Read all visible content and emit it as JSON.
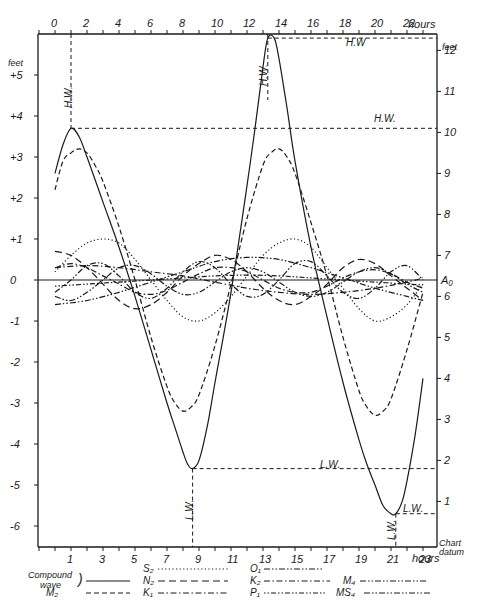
{
  "chart_data": {
    "type": "line",
    "title": "",
    "xlabel": "hours",
    "ylabel_left": "feet",
    "ylabel_right": "feet",
    "top_axis": {
      "ticks": [
        0,
        2,
        4,
        6,
        8,
        10,
        12,
        14,
        16,
        18,
        20,
        22
      ],
      "unit": "hours"
    },
    "bottom_axis": {
      "ticks": [
        1,
        3,
        5,
        7,
        9,
        11,
        13,
        15,
        17,
        19,
        21,
        23
      ],
      "unit": "hours"
    },
    "left_axis": {
      "ticks": [
        5,
        4,
        3,
        2,
        1,
        0,
        -1,
        -2,
        -3,
        -4,
        -5,
        -6
      ],
      "labels": [
        "+5",
        "+4",
        "+3",
        "+2",
        "+1",
        "0",
        "-1",
        "-2",
        "-3",
        "-4",
        "-5",
        "-6"
      ],
      "unit": "feet"
    },
    "right_axis": {
      "ticks": [
        12,
        11,
        10,
        9,
        8,
        7,
        6,
        5,
        4,
        3,
        2,
        1
      ],
      "labels": [
        "12",
        "11",
        "10",
        "9",
        "8",
        "7",
        "6",
        "5",
        "4",
        "3",
        "2",
        "1"
      ],
      "unit": "feet",
      "a0_label": "A₀",
      "a0_value": 6.4,
      "datum_label": [
        "Chart",
        "datum"
      ]
    },
    "xlim": [
      -1,
      23.9
    ],
    "ylim": [
      -6.5,
      6.1
    ],
    "grid": false,
    "annotations": [
      {
        "text": "H.W.",
        "x": 1.0,
        "y": 3.7,
        "type": "high-water"
      },
      {
        "text": "H.W",
        "x": 13.3,
        "y": 5.9,
        "type": "high-water"
      },
      {
        "text": "L.W.",
        "x": 8.6,
        "y": -4.6,
        "type": "low-water"
      },
      {
        "text": "L.W.",
        "x": 21.3,
        "y": -5.7,
        "type": "low-water"
      }
    ],
    "series": [
      {
        "name": "Compound wave",
        "style": "solid",
        "x": [
          0,
          0.5,
          1,
          1.5,
          2,
          3,
          4,
          5,
          6,
          7,
          7.5,
          8,
          8.3,
          8.6,
          9,
          9.5,
          10,
          11,
          12,
          12.5,
          13,
          13.3,
          13.7,
          14,
          14.5,
          15,
          16,
          17,
          18,
          19,
          19.5,
          20,
          20.5,
          21,
          21.3,
          21.7,
          22,
          22.5,
          23
        ],
        "y": [
          2.6,
          3.3,
          3.7,
          3.5,
          3.0,
          1.9,
          0.8,
          -0.4,
          -1.7,
          -3.0,
          -3.6,
          -4.2,
          -4.5,
          -4.6,
          -4.4,
          -3.6,
          -2.5,
          -0.3,
          2.3,
          3.7,
          5.2,
          5.9,
          5.9,
          5.4,
          4.2,
          2.9,
          0.8,
          -0.9,
          -2.5,
          -3.9,
          -4.5,
          -5.0,
          -5.5,
          -5.7,
          -5.7,
          -5.4,
          -4.9,
          -3.8,
          -2.4
        ]
      },
      {
        "name": "M2",
        "style": "dash",
        "x": [
          0,
          0.5,
          1,
          1.5,
          2,
          2.5,
          3,
          4,
          5,
          6,
          7,
          7.5,
          8,
          8.5,
          9,
          10,
          11,
          12,
          13,
          13.5,
          14,
          14.5,
          15,
          16,
          17,
          18,
          19,
          19.5,
          20,
          20.5,
          21,
          22,
          23
        ],
        "y": [
          2.2,
          2.9,
          3.1,
          3.2,
          3.1,
          2.8,
          2.4,
          1.3,
          0.0,
          -1.4,
          -2.6,
          -3.0,
          -3.2,
          -3.1,
          -2.8,
          -1.6,
          -0.1,
          1.5,
          2.8,
          3.1,
          3.2,
          3.0,
          2.6,
          1.4,
          0.1,
          -1.4,
          -2.7,
          -3.1,
          -3.3,
          -3.2,
          -2.9,
          -1.7,
          -0.3
        ]
      },
      {
        "name": "S2",
        "style": "dot",
        "x": [
          0,
          1,
          2,
          3,
          4,
          5,
          6,
          7,
          8,
          9,
          10,
          11,
          12,
          13,
          14,
          15,
          16,
          17,
          18,
          19,
          20,
          21,
          22,
          23
        ],
        "y": [
          0.2,
          0.6,
          0.9,
          1.0,
          0.9,
          0.5,
          0.0,
          -0.5,
          -0.9,
          -1.0,
          -0.8,
          -0.4,
          0.1,
          0.6,
          0.9,
          1.0,
          0.8,
          0.3,
          -0.2,
          -0.7,
          -1.0,
          -0.9,
          -0.6,
          -0.1
        ]
      },
      {
        "name": "N2",
        "style": "longdash",
        "x": [
          0,
          1,
          2,
          3,
          4,
          5,
          6,
          7,
          8,
          9,
          10,
          11,
          12,
          13,
          14,
          15,
          16,
          17,
          18,
          19,
          20,
          21,
          22,
          23
        ],
        "y": [
          0.7,
          0.6,
          0.3,
          -0.1,
          -0.5,
          -0.7,
          -0.6,
          -0.3,
          0.1,
          0.4,
          0.6,
          0.5,
          0.2,
          -0.2,
          -0.5,
          -0.6,
          -0.4,
          -0.1,
          0.3,
          0.5,
          0.4,
          0.1,
          -0.2,
          -0.5
        ]
      },
      {
        "name": "K1",
        "style": "dashdot",
        "x": [
          0,
          2,
          4,
          6,
          8,
          10,
          12,
          14,
          16,
          18,
          20,
          22,
          23
        ],
        "y": [
          0.3,
          0.35,
          0.3,
          0.2,
          0.1,
          -0.05,
          -0.2,
          -0.3,
          -0.35,
          -0.3,
          -0.2,
          -0.05,
          0.05
        ]
      },
      {
        "name": "O1",
        "style": "dashdotdot",
        "x": [
          0,
          2,
          4,
          6,
          8,
          10,
          12,
          14,
          16,
          18,
          20,
          22,
          23
        ],
        "y": [
          -0.6,
          -0.5,
          -0.3,
          -0.05,
          0.2,
          0.45,
          0.55,
          0.5,
          0.3,
          0.05,
          -0.2,
          -0.4,
          -0.5
        ]
      },
      {
        "name": "K2",
        "style": "dashdot",
        "x": [
          0,
          1,
          2,
          3,
          4,
          5,
          6,
          7,
          8,
          9,
          10,
          11,
          12,
          13,
          14,
          15,
          16,
          17,
          18,
          19,
          20,
          21,
          22,
          23
        ],
        "y": [
          0.3,
          0.4,
          0.3,
          0.1,
          -0.1,
          -0.3,
          -0.35,
          -0.25,
          -0.05,
          0.15,
          0.3,
          0.3,
          0.2,
          0.0,
          -0.2,
          -0.3,
          -0.3,
          -0.15,
          0.05,
          0.2,
          0.25,
          0.15,
          -0.05,
          -0.2
        ]
      },
      {
        "name": "P1",
        "style": "dotdash",
        "x": [
          0,
          2,
          4,
          6,
          8,
          10,
          12,
          14,
          16,
          18,
          20,
          22,
          23
        ],
        "y": [
          -0.15,
          -0.1,
          -0.05,
          0.0,
          0.05,
          0.1,
          0.12,
          0.1,
          0.05,
          0.0,
          -0.05,
          -0.1,
          -0.12
        ]
      },
      {
        "name": "M4",
        "style": "dashdotdot",
        "x": [
          0,
          1,
          2,
          3,
          4,
          5,
          6,
          7,
          8,
          9,
          10,
          11,
          12,
          13,
          14,
          15,
          16,
          17,
          18,
          19,
          20,
          21,
          22,
          23
        ],
        "y": [
          -0.3,
          0.0,
          0.35,
          0.4,
          0.1,
          -0.3,
          -0.45,
          -0.2,
          0.2,
          0.45,
          0.3,
          -0.1,
          -0.4,
          -0.35,
          0.0,
          0.4,
          0.45,
          0.1,
          -0.3,
          -0.45,
          -0.2,
          0.2,
          0.35,
          0.0
        ]
      },
      {
        "name": "MS4",
        "style": "dashdotdot",
        "x": [
          0,
          1,
          2,
          3,
          4,
          5,
          6,
          7,
          8,
          9,
          10,
          11,
          12,
          13,
          14,
          15,
          16,
          17,
          18,
          19,
          20,
          21,
          22,
          23
        ],
        "y": [
          -0.4,
          -0.5,
          -0.3,
          0.0,
          0.3,
          0.35,
          0.15,
          -0.15,
          -0.35,
          -0.3,
          -0.05,
          0.2,
          0.3,
          0.2,
          -0.05,
          -0.3,
          -0.4,
          -0.3,
          -0.05,
          0.2,
          0.3,
          0.15,
          -0.1,
          -0.3
        ]
      }
    ],
    "legend": {
      "position": "bottom",
      "entries": [
        {
          "label": "Compound wave",
          "style": "solid"
        },
        {
          "label": "M₂",
          "style": "dash"
        },
        {
          "label": "S₂",
          "style": "dot"
        },
        {
          "label": "N₂",
          "style": "longdash"
        },
        {
          "label": "K₁",
          "style": "dashdot"
        },
        {
          "label": "O₁",
          "style": "dashdotdot"
        },
        {
          "label": "K₂",
          "style": "dashdot"
        },
        {
          "label": "P₁",
          "style": "dotdash"
        },
        {
          "label": "M₄",
          "style": "dashdotdot"
        },
        {
          "label": "MS₄",
          "style": "dashdotdot"
        }
      ]
    }
  },
  "labels": {
    "hours_top": "hours",
    "hours_bottom": "hours",
    "feet_left": "feet",
    "feet_right": "feet",
    "hw_left_vertical": "H.W.",
    "hw_right_vertical": "H.W.",
    "hw_top_line": "H.W",
    "hw_mid_line": "H.W.",
    "lw_mid_line": "L.W.",
    "lw_low_line": "L.W.",
    "lw_left_vertical": "L.W.",
    "lw_right_vertical": "L.W.",
    "a0": "A₀",
    "chart_datum_1": "Chart",
    "chart_datum_2": "datum",
    "legend_compound_1": "Compound",
    "legend_compound_2": "wave"
  }
}
